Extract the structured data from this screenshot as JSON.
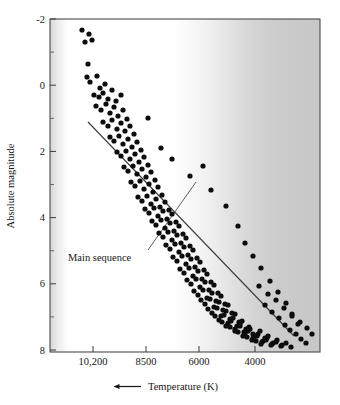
{
  "chart_data": {
    "type": "scatter",
    "title": "",
    "xlabel": "Temperature (K)",
    "ylabel": "Absolute magnitude",
    "xlabel_arrow": "←",
    "xtick_labels": [
      "10,200",
      "8500",
      "6000",
      "4000"
    ],
    "xtick_values": [
      10200,
      8500,
      6000,
      4000
    ],
    "ytick_labels": [
      "-2",
      "0",
      "2",
      "4",
      "6",
      "8"
    ],
    "ytick_values": [
      -2,
      0,
      2,
      4,
      6,
      8
    ],
    "xlim": [
      11600,
      2900
    ],
    "ylim": [
      -2.6,
      8.6
    ],
    "x_axis_direction": "decreasing",
    "y_axis_direction": "inverted",
    "grid": false,
    "legend": "none",
    "minor_ticks_y": true,
    "annotations": [
      {
        "text": "Main sequence",
        "text_x": 68,
        "text_y": 261,
        "leader_from_x": 148,
        "leader_from_y": 250,
        "leader_to_x": 196,
        "leader_to_y": 182
      }
    ],
    "trendline": {
      "name": "Main sequence fit",
      "x1_px": 88,
      "y1_px": 122,
      "x2_px": 294,
      "y2_px": 336,
      "color": "#3b3b3b"
    },
    "background_gradient": {
      "description": "Color-temperature band: white at hot (left) fading to gray at cool (right)",
      "stops": [
        "#d8d8d8",
        "#ffffff",
        "#ffffff",
        "#f2f2f2",
        "#dcdcdc",
        "#cfcfcf",
        "#c9c9c9"
      ]
    },
    "marker": {
      "shape": "circle",
      "color": "#0d0d0d",
      "radius_px": 2.6
    },
    "n_points": 188,
    "points_px": [
      [
        82,
        30
      ],
      [
        89,
        34
      ],
      [
        85,
        42
      ],
      [
        92,
        40
      ],
      [
        88,
        64
      ],
      [
        87,
        77
      ],
      [
        90,
        82
      ],
      [
        97,
        76
      ],
      [
        100,
        88
      ],
      [
        105,
        84
      ],
      [
        94,
        95
      ],
      [
        99,
        97
      ],
      [
        103,
        93
      ],
      [
        108,
        99
      ],
      [
        112,
        90
      ],
      [
        116,
        101
      ],
      [
        121,
        95
      ],
      [
        96,
        106
      ],
      [
        101,
        110
      ],
      [
        106,
        104
      ],
      [
        110,
        113
      ],
      [
        114,
        107
      ],
      [
        118,
        116
      ],
      [
        123,
        110
      ],
      [
        127,
        119
      ],
      [
        103,
        122
      ],
      [
        108,
        126
      ],
      [
        112,
        120
      ],
      [
        117,
        129
      ],
      [
        121,
        123
      ],
      [
        125,
        131
      ],
      [
        130,
        126
      ],
      [
        134,
        134
      ],
      [
        110,
        137
      ],
      [
        114,
        141
      ],
      [
        119,
        136
      ],
      [
        123,
        144
      ],
      [
        128,
        139
      ],
      [
        132,
        147
      ],
      [
        137,
        142
      ],
      [
        141,
        150
      ],
      [
        117,
        152
      ],
      [
        121,
        156
      ],
      [
        126,
        151
      ],
      [
        130,
        159
      ],
      [
        135,
        154
      ],
      [
        139,
        162
      ],
      [
        144,
        157
      ],
      [
        148,
        165
      ],
      [
        124,
        167
      ],
      [
        128,
        171
      ],
      [
        133,
        166
      ],
      [
        137,
        174
      ],
      [
        142,
        169
      ],
      [
        146,
        177
      ],
      [
        151,
        172
      ],
      [
        155,
        180
      ],
      [
        131,
        182
      ],
      [
        135,
        186
      ],
      [
        140,
        181
      ],
      [
        144,
        189
      ],
      [
        149,
        184
      ],
      [
        153,
        192
      ],
      [
        158,
        187
      ],
      [
        162,
        195
      ],
      [
        138,
        197
      ],
      [
        142,
        201
      ],
      [
        147,
        196
      ],
      [
        151,
        204
      ],
      [
        156,
        199
      ],
      [
        160,
        207
      ],
      [
        165,
        202
      ],
      [
        169,
        210
      ],
      [
        145,
        209
      ],
      [
        149,
        213
      ],
      [
        154,
        208
      ],
      [
        158,
        216
      ],
      [
        163,
        211
      ],
      [
        167,
        219
      ],
      [
        172,
        214
      ],
      [
        176,
        222
      ],
      [
        152,
        221
      ],
      [
        156,
        225
      ],
      [
        161,
        220
      ],
      [
        165,
        228
      ],
      [
        170,
        223
      ],
      [
        174,
        231
      ],
      [
        179,
        226
      ],
      [
        183,
        234
      ],
      [
        159,
        233
      ],
      [
        163,
        237
      ],
      [
        168,
        232
      ],
      [
        172,
        240
      ],
      [
        177,
        235
      ],
      [
        181,
        243
      ],
      [
        186,
        238
      ],
      [
        190,
        246
      ],
      [
        166,
        245
      ],
      [
        170,
        249
      ],
      [
        175,
        244
      ],
      [
        179,
        252
      ],
      [
        184,
        247
      ],
      [
        188,
        255
      ],
      [
        193,
        250
      ],
      [
        197,
        258
      ],
      [
        173,
        257
      ],
      [
        177,
        261
      ],
      [
        182,
        256
      ],
      [
        186,
        264
      ],
      [
        191,
        259
      ],
      [
        195,
        267
      ],
      [
        200,
        262
      ],
      [
        204,
        270
      ],
      [
        180,
        269
      ],
      [
        184,
        273
      ],
      [
        189,
        268
      ],
      [
        193,
        276
      ],
      [
        198,
        271
      ],
      [
        202,
        279
      ],
      [
        207,
        274
      ],
      [
        211,
        282
      ],
      [
        187,
        280
      ],
      [
        191,
        284
      ],
      [
        196,
        279
      ],
      [
        200,
        287
      ],
      [
        205,
        282
      ],
      [
        209,
        290
      ],
      [
        214,
        285
      ],
      [
        218,
        293
      ],
      [
        194,
        291
      ],
      [
        198,
        295
      ],
      [
        203,
        290
      ],
      [
        207,
        298
      ],
      [
        212,
        293
      ],
      [
        216,
        301
      ],
      [
        221,
        296
      ],
      [
        225,
        304
      ],
      [
        201,
        300
      ],
      [
        205,
        304
      ],
      [
        210,
        299
      ],
      [
        214,
        307
      ],
      [
        219,
        302
      ],
      [
        223,
        310
      ],
      [
        228,
        305
      ],
      [
        232,
        313
      ],
      [
        208,
        309
      ],
      [
        212,
        313
      ],
      [
        217,
        308
      ],
      [
        221,
        316
      ],
      [
        226,
        311
      ],
      [
        230,
        319
      ],
      [
        235,
        314
      ],
      [
        239,
        322
      ],
      [
        215,
        316
      ],
      [
        219,
        320
      ],
      [
        224,
        315
      ],
      [
        228,
        323
      ],
      [
        233,
        318
      ],
      [
        237,
        326
      ],
      [
        242,
        321
      ],
      [
        246,
        329
      ],
      [
        222,
        322
      ],
      [
        226,
        326
      ],
      [
        231,
        321
      ],
      [
        235,
        329
      ],
      [
        240,
        324
      ],
      [
        244,
        332
      ],
      [
        249,
        327
      ],
      [
        253,
        334
      ],
      [
        230,
        327
      ],
      [
        235,
        331
      ],
      [
        240,
        326
      ],
      [
        245,
        333
      ],
      [
        250,
        329
      ],
      [
        255,
        336
      ],
      [
        260,
        331
      ],
      [
        265,
        338
      ],
      [
        238,
        332
      ],
      [
        243,
        336
      ],
      [
        248,
        331
      ],
      [
        253,
        338
      ],
      [
        258,
        334
      ],
      [
        263,
        341
      ],
      [
        268,
        336
      ],
      [
        273,
        343
      ],
      [
        247,
        337
      ],
      [
        252,
        340
      ],
      [
        257,
        336
      ],
      [
        262,
        342
      ],
      [
        267,
        338
      ],
      [
        272,
        344
      ],
      [
        277,
        340
      ],
      [
        282,
        345
      ],
      [
        256,
        341
      ],
      [
        261,
        344
      ],
      [
        266,
        340
      ],
      [
        271,
        345
      ],
      [
        276,
        342
      ],
      [
        281,
        346
      ],
      [
        286,
        343
      ],
      [
        291,
        347
      ],
      [
        148,
        118
      ],
      [
        161,
        148
      ],
      [
        172,
        159
      ],
      [
        190,
        176
      ],
      [
        203,
        166
      ],
      [
        211,
        190
      ],
      [
        226,
        206
      ],
      [
        238,
        226
      ],
      [
        245,
        243
      ],
      [
        253,
        256
      ],
      [
        261,
        268
      ],
      [
        270,
        281
      ],
      [
        278,
        292
      ],
      [
        286,
        303
      ],
      [
        292,
        314
      ],
      [
        298,
        324
      ],
      [
        265,
        305
      ],
      [
        272,
        312
      ],
      [
        279,
        318
      ],
      [
        285,
        325
      ],
      [
        290,
        330
      ],
      [
        296,
        334
      ],
      [
        301,
        339
      ],
      [
        306,
        343
      ],
      [
        259,
        286
      ],
      [
        268,
        294
      ],
      [
        276,
        300
      ],
      [
        284,
        308
      ],
      [
        292,
        316
      ],
      [
        300,
        322
      ],
      [
        307,
        328
      ],
      [
        312,
        334
      ]
    ]
  }
}
